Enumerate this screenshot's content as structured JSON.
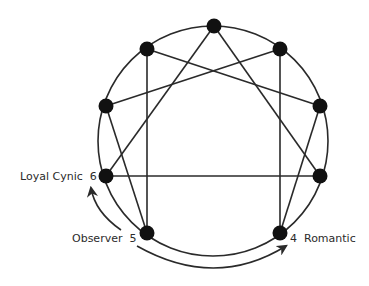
{
  "diagram": {
    "type": "enneagram",
    "colors": {
      "line": "#2a2a2a",
      "node": "#111111",
      "text": "#2b2b2b",
      "background": "#ffffff"
    },
    "circle": {
      "cx": 213,
      "cy": 141,
      "r": 115
    },
    "nodes": [
      {
        "id": 9,
        "x": 214,
        "y": 26
      },
      {
        "id": 1,
        "x": 280,
        "y": 49
      },
      {
        "id": 2,
        "x": 320,
        "y": 106
      },
      {
        "id": 3,
        "x": 320,
        "y": 176
      },
      {
        "id": 4,
        "x": 280,
        "y": 233
      },
      {
        "id": 5,
        "x": 147,
        "y": 233
      },
      {
        "id": 6,
        "x": 106,
        "y": 176
      },
      {
        "id": 7,
        "x": 106,
        "y": 106
      },
      {
        "id": 8,
        "x": 147,
        "y": 49
      }
    ],
    "edges": [
      [
        9,
        3
      ],
      [
        3,
        6
      ],
      [
        6,
        9
      ],
      [
        1,
        4
      ],
      [
        4,
        2
      ],
      [
        2,
        8
      ],
      [
        8,
        5
      ],
      [
        5,
        7
      ],
      [
        7,
        1
      ]
    ],
    "labels": {
      "six": "Loyal Cynic  6",
      "five": "Observer  5",
      "four": "4  Romantic"
    },
    "arrows": [
      {
        "from": "Observer 5",
        "to": "Loyal Cynic 6"
      },
      {
        "from": "Observer 5",
        "to": "Romantic 4"
      }
    ]
  }
}
